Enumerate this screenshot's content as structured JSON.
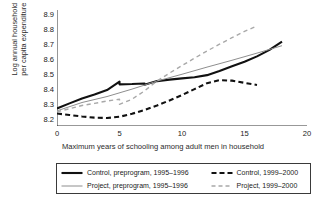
{
  "chart_data": {
    "type": "line",
    "title": "",
    "xlabel": "Maximum years of schooling among adult men in household",
    "ylabel": "Log annual household per capita expenditure",
    "ylabel_line1": "Log annual household",
    "ylabel_line2": "per capita expenditure",
    "xlim": [
      0,
      20
    ],
    "ylim": [
      8.15,
      8.93
    ],
    "xticks": [
      0,
      5,
      10,
      15,
      20
    ],
    "xtick_labels": [
      "0",
      "5",
      "10",
      "15",
      "20"
    ],
    "yticks": [
      8.2,
      8.3,
      8.4,
      8.5,
      8.6,
      8.7,
      8.8,
      8.9
    ],
    "ytick_labels": [
      "8.2",
      "8.3",
      "8.4",
      "8.5",
      "8.6",
      "8.7",
      "8.8",
      "8.9"
    ],
    "grid": false,
    "legend_position": "below",
    "series": [
      {
        "name": "Control, preprogram, 1995–1996",
        "style": "solid",
        "color": "#111111",
        "width": 2.1,
        "x": [
          0,
          1,
          2,
          3,
          4,
          5,
          5,
          6,
          7,
          7,
          8,
          9,
          10,
          11,
          12,
          13,
          14,
          15,
          16,
          17,
          18
        ],
        "y": [
          8.268,
          8.302,
          8.335,
          8.362,
          8.392,
          8.448,
          8.43,
          8.432,
          8.436,
          8.427,
          8.452,
          8.462,
          8.47,
          8.478,
          8.492,
          8.52,
          8.552,
          8.582,
          8.618,
          8.662,
          8.718
        ]
      },
      {
        "name": "Control, 1999–2000",
        "style": "dashed",
        "color": "#111111",
        "width": 2.1,
        "x": [
          0,
          1,
          2,
          3,
          4,
          5,
          6,
          7,
          8,
          9,
          10,
          11,
          12,
          13,
          14,
          15,
          16
        ],
        "y": [
          8.234,
          8.224,
          8.214,
          8.206,
          8.204,
          8.212,
          8.232,
          8.258,
          8.288,
          8.322,
          8.358,
          8.398,
          8.438,
          8.458,
          8.455,
          8.44,
          8.426
        ]
      },
      {
        "name": "Project, preprogram, 1995–1996",
        "style": "solid",
        "color": "#8e8e8e",
        "width": 1.0,
        "x": [
          0,
          2,
          4,
          6,
          8,
          10,
          12,
          14,
          16,
          18
        ],
        "y": [
          8.252,
          8.308,
          8.348,
          8.398,
          8.452,
          8.498,
          8.546,
          8.592,
          8.64,
          8.69
        ]
      },
      {
        "name": "Project, 1999–2000",
        "style": "dashed",
        "color": "#a8a8a8",
        "width": 1.4,
        "x": [
          0,
          1,
          2,
          3,
          4,
          5,
          5,
          6,
          7,
          8,
          9,
          10,
          11,
          12,
          13,
          14,
          15,
          16
        ],
        "y": [
          8.246,
          8.266,
          8.288,
          8.302,
          8.318,
          8.33,
          8.296,
          8.33,
          8.386,
          8.452,
          8.506,
          8.556,
          8.606,
          8.654,
          8.7,
          8.744,
          8.786,
          8.822
        ]
      }
    ]
  },
  "legend": {
    "entries": [
      {
        "label": "Control, preprogram, 1995–1996",
        "style": "solid",
        "color": "#111111",
        "width": 2.1
      },
      {
        "label": "Control, 1999–2000",
        "style": "dashed",
        "color": "#111111",
        "width": 2.1
      },
      {
        "label": "Project, preprogram, 1995–1996",
        "style": "solid",
        "color": "#8e8e8e",
        "width": 1.0
      },
      {
        "label": "Project, 1999–2000",
        "style": "dashed",
        "color": "#a8a8a8",
        "width": 1.4
      }
    ]
  },
  "colors": {
    "axis": "#1a1a1a",
    "control": "#111111",
    "project": "#8e8e8e",
    "background": "#ffffff"
  }
}
